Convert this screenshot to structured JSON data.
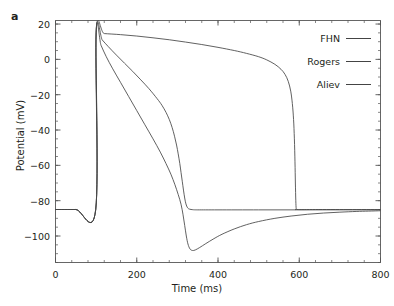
{
  "figure": {
    "panel_label": "a"
  },
  "chart_data": {
    "type": "line",
    "title": "",
    "xlabel": "Time (ms)",
    "ylabel": "Potential (mV)",
    "xlim": [
      0,
      800
    ],
    "ylim": [
      -115,
      22
    ],
    "grid": false,
    "legend_position": "top-right",
    "xticks": [
      0,
      200,
      400,
      600,
      800
    ],
    "xtick_labels": [
      "0",
      "200",
      "400",
      "600",
      "800"
    ],
    "yticks": [
      20,
      0,
      -20,
      -40,
      -60,
      -80,
      -100
    ],
    "ytick_labels": [
      "20",
      "0",
      "−20",
      "−40",
      "−60",
      "−80",
      "−100"
    ],
    "x_minor_tick_step": 40,
    "y_minor_tick_step": 5,
    "resting_potential": -85,
    "peak_potential": 15,
    "stimulus_time": 100,
    "series": [
      {
        "name": "FHN",
        "color": "#444444",
        "points": [
          [
            0,
            -85
          ],
          [
            50,
            -85
          ],
          [
            99,
            -85
          ],
          [
            100,
            15
          ],
          [
            120,
            14.6
          ],
          [
            160,
            14.0
          ],
          [
            200,
            13.2
          ],
          [
            240,
            12.2
          ],
          [
            280,
            11.1
          ],
          [
            320,
            9.8
          ],
          [
            360,
            8.4
          ],
          [
            400,
            6.8
          ],
          [
            440,
            5.0
          ],
          [
            470,
            3.4
          ],
          [
            500,
            1.5
          ],
          [
            520,
            -0.3
          ],
          [
            540,
            -2.8
          ],
          [
            555,
            -5.6
          ],
          [
            565,
            -8.5
          ],
          [
            573,
            -12.5
          ],
          [
            579,
            -18.0
          ],
          [
            583,
            -25.0
          ],
          [
            586,
            -34.0
          ],
          [
            588,
            -45.0
          ],
          [
            589.5,
            -58.0
          ],
          [
            590.5,
            -70.0
          ],
          [
            591.5,
            -80.0
          ],
          [
            592.5,
            -84.5
          ],
          [
            594,
            -85
          ],
          [
            640,
            -85
          ],
          [
            720,
            -85
          ],
          [
            800,
            -85
          ]
        ]
      },
      {
        "name": "Rogers",
        "color": "#444444",
        "points": [
          [
            0,
            -85
          ],
          [
            50,
            -85
          ],
          [
            99,
            -85
          ],
          [
            100,
            15
          ],
          [
            115,
            11.0
          ],
          [
            130,
            7.2
          ],
          [
            150,
            2.4
          ],
          [
            170,
            -2.2
          ],
          [
            190,
            -6.8
          ],
          [
            210,
            -11.6
          ],
          [
            230,
            -16.6
          ],
          [
            250,
            -22.2
          ],
          [
            262,
            -26.0
          ],
          [
            272,
            -30.0
          ],
          [
            280,
            -34.0
          ],
          [
            287,
            -38.5
          ],
          [
            293,
            -43.5
          ],
          [
            298,
            -48.5
          ],
          [
            302,
            -53.5
          ],
          [
            306,
            -59.0
          ],
          [
            309,
            -64.0
          ],
          [
            312,
            -69.0
          ],
          [
            315,
            -74.0
          ],
          [
            318,
            -78.5
          ],
          [
            321,
            -81.8
          ],
          [
            325,
            -84.0
          ],
          [
            330,
            -84.8
          ],
          [
            338,
            -85.1
          ],
          [
            350,
            -85.2
          ],
          [
            400,
            -85.2
          ],
          [
            500,
            -85.2
          ],
          [
            600,
            -85.2
          ],
          [
            700,
            -85.2
          ],
          [
            800,
            -85.2
          ]
        ]
      },
      {
        "name": "Aliev",
        "color": "#444444",
        "points": [
          [
            0,
            -85
          ],
          [
            50,
            -85
          ],
          [
            99,
            -85
          ],
          [
            100,
            15
          ],
          [
            112,
            8.0
          ],
          [
            125,
            1.5
          ],
          [
            140,
            -5.0
          ],
          [
            160,
            -13.0
          ],
          [
            180,
            -21.0
          ],
          [
            200,
            -29.0
          ],
          [
            220,
            -37.0
          ],
          [
            240,
            -45.0
          ],
          [
            258,
            -52.5
          ],
          [
            272,
            -59.0
          ],
          [
            284,
            -65.0
          ],
          [
            294,
            -71.0
          ],
          [
            302,
            -76.5
          ],
          [
            309,
            -82.0
          ],
          [
            314,
            -88.0
          ],
          [
            318,
            -94.0
          ],
          [
            322,
            -100.0
          ],
          [
            326,
            -104.5
          ],
          [
            331,
            -107.3
          ],
          [
            337,
            -108.2
          ],
          [
            344,
            -107.9
          ],
          [
            355,
            -106.5
          ],
          [
            370,
            -104.3
          ],
          [
            390,
            -101.5
          ],
          [
            410,
            -99.0
          ],
          [
            440,
            -96.0
          ],
          [
            470,
            -93.6
          ],
          [
            500,
            -91.8
          ],
          [
            540,
            -90.0
          ],
          [
            580,
            -88.7
          ],
          [
            620,
            -87.7
          ],
          [
            660,
            -87.0
          ],
          [
            700,
            -86.5
          ],
          [
            740,
            -86.1
          ],
          [
            770,
            -85.9
          ],
          [
            800,
            -85.7
          ]
        ]
      }
    ],
    "legend": [
      {
        "label": "FHN",
        "color": "#444444"
      },
      {
        "label": "Rogers",
        "color": "#444444"
      },
      {
        "label": "Aliev",
        "color": "#444444"
      }
    ]
  }
}
